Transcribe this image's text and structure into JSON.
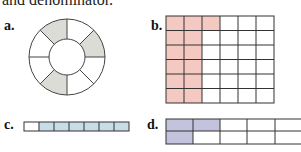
{
  "intro_text": "and denominator.",
  "figures": {
    "a": {
      "label": "a.",
      "type": "ring",
      "segments": 8,
      "shaded_segments": [
        0,
        2,
        4
      ],
      "shade_color": "#dcdcd6"
    },
    "b": {
      "label": "b.",
      "type": "grid",
      "rows": 6,
      "cols": 6,
      "shaded_cells": 14,
      "shade_color": "#f3c9c2"
    },
    "c": {
      "label": "c.",
      "type": "strip",
      "cells": 7,
      "shaded_cells": 6,
      "shade_color": "#c9dcea"
    },
    "d": {
      "label": "d.",
      "type": "grid",
      "rows": 2,
      "cols": 5,
      "shaded_cells": 3,
      "shade_color": "#c3c3dd"
    }
  }
}
